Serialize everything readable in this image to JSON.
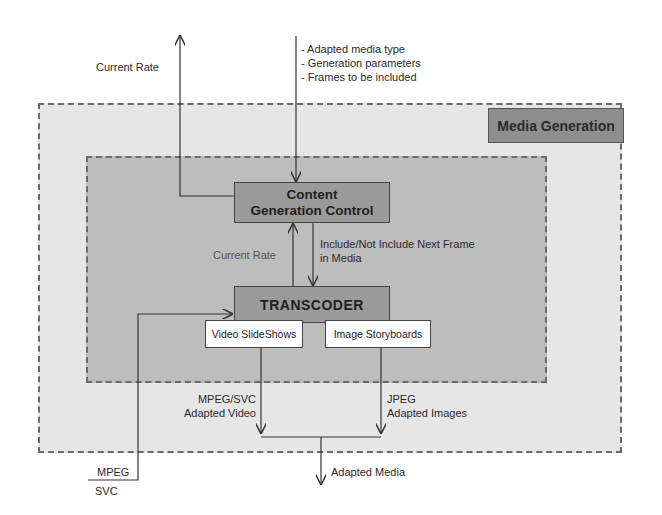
{
  "diagram": {
    "regions": {
      "outer_label": "Media Generation"
    },
    "blocks": {
      "content_generation_control": [
        "Content",
        "Generation Control"
      ],
      "transcoder": "TRANSCODER",
      "video_slideshows": "Video SlideShows",
      "image_storyboards": "Image Storyboards"
    },
    "labels": {
      "current_rate_top": "Current Rate",
      "input_params": [
        "- Adapted media type",
        "- Generation parameters",
        "- Frames to be included"
      ],
      "current_rate_inner": "Current Rate",
      "include_frame": [
        "Include/Not Include Next Frame",
        "in Media"
      ],
      "mpeg_svc_video": [
        "MPEG/SVC",
        "Adapted Video"
      ],
      "jpeg_images": [
        "JPEG",
        "Adapted Images"
      ],
      "adapted_media": "Adapted Media",
      "input_mpeg": "MPEG",
      "input_svc": "SVC"
    },
    "edges": [
      {
        "from": "Content Generation Control",
        "to": "external",
        "label": "Current Rate"
      },
      {
        "from": "external",
        "to": "Content Generation Control",
        "label": "Adapted media type / Generation parameters / Frames to be included"
      },
      {
        "from": "TRANSCODER",
        "to": "Content Generation Control",
        "label": "Current Rate"
      },
      {
        "from": "Content Generation Control",
        "to": "TRANSCODER",
        "label": "Include/Not Include Next Frame in Media"
      },
      {
        "from": "MPEG/SVC input",
        "to": "TRANSCODER",
        "label": "MPEG / SVC"
      },
      {
        "from": "Video SlideShows",
        "to": "merge",
        "label": "MPEG/SVC Adapted Video"
      },
      {
        "from": "Image Storyboards",
        "to": "merge",
        "label": "JPEG Adapted Images"
      },
      {
        "from": "merge",
        "to": "external",
        "label": "Adapted Media"
      }
    ],
    "colors": {
      "outer_fill": "#e6e6e6",
      "inner_fill": "#bdbdbd",
      "block_fill": "#9a9a9a",
      "label_fill": "#8e8e8e",
      "line": "#333333"
    }
  }
}
